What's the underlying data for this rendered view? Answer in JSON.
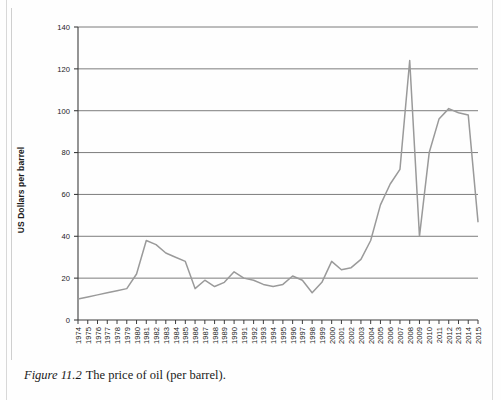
{
  "figure": {
    "number": "Figure 11.2",
    "caption": "The price of oil (per barrel)."
  },
  "chart_data": {
    "type": "line",
    "title": "",
    "xlabel": "",
    "ylabel": "US Dollars per barrel",
    "ylim": [
      0,
      140
    ],
    "ytick_step": 20,
    "yticks": [
      "0",
      "20",
      "40",
      "60",
      "80",
      "100",
      "120",
      "140"
    ],
    "grid": "horizontal",
    "legend": "none",
    "line_color": "#9a9a9a",
    "axis_color": "#3d3d3d",
    "categories": [
      "1974",
      "1975",
      "1976",
      "1977",
      "1978",
      "1979",
      "1980",
      "1981",
      "1982",
      "1983",
      "1984",
      "1985",
      "1986",
      "1987",
      "1988",
      "1989",
      "1990",
      "1991",
      "1992",
      "1993",
      "1994",
      "1995",
      "1996",
      "1997",
      "1998",
      "1999",
      "2000",
      "2001",
      "2002",
      "2003",
      "2004",
      "2005",
      "2006",
      "2007",
      "2008",
      "2009",
      "2010",
      "2011",
      "2012",
      "2013",
      "2014",
      "2015"
    ],
    "values": [
      10,
      11,
      12,
      13,
      14,
      15,
      22,
      38,
      36,
      32,
      30,
      28,
      15,
      19,
      16,
      18,
      23,
      20,
      19,
      17,
      16,
      17,
      21,
      19,
      13,
      18,
      28,
      24,
      25,
      29,
      38,
      55,
      65,
      72,
      124,
      40,
      80,
      96,
      101,
      99,
      98,
      47
    ]
  }
}
